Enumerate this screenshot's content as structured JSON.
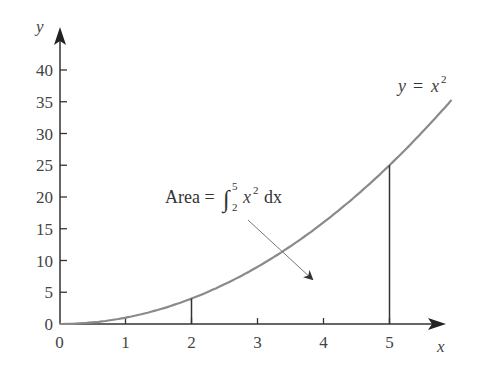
{
  "chart_data": {
    "type": "line",
    "title": "",
    "xlabel": "x",
    "ylabel": "y",
    "xlim": [
      0,
      6
    ],
    "ylim": [
      0,
      42
    ],
    "x_ticks": [
      "0",
      "1",
      "2",
      "3",
      "4",
      "5"
    ],
    "y_ticks": [
      "0",
      "5",
      "10",
      "15",
      "20",
      "25",
      "30",
      "35",
      "40"
    ],
    "grid": false,
    "series": [
      {
        "name": "y = x^2",
        "x": [
          0,
          0.5,
          1,
          1.5,
          2,
          2.5,
          3,
          3.5,
          4,
          4.5,
          5,
          5.5,
          5.94
        ],
        "values": [
          0,
          0.25,
          1,
          2.25,
          4,
          6.25,
          9,
          12.25,
          16,
          20.25,
          25,
          30.25,
          35.3
        ]
      }
    ],
    "vertical_lines": [
      {
        "x": 2,
        "y_top": 4
      },
      {
        "x": 5,
        "y_top": 25
      }
    ],
    "annotations": [
      {
        "text": "y = x²",
        "position": "near curve end"
      },
      {
        "text": "Area = ∫₂⁵ x² dx",
        "arrow_to": "region under curve between x=2 and x=5"
      }
    ]
  },
  "labels": {
    "y_axis": "y",
    "x_axis": "x",
    "curve": {
      "y": "y",
      "eq": "=",
      "x": "x",
      "exp": "2"
    },
    "area": {
      "word": "Area =",
      "upper": "5",
      "lower": "2",
      "x": "x",
      "exp": "2",
      "dx": "dx"
    }
  }
}
